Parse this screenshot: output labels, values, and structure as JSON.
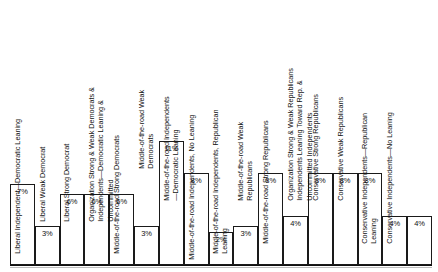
{
  "chart_data": {
    "type": "bar",
    "title": "",
    "xlabel": "",
    "ylabel": "",
    "ylim": [
      0,
      11
    ],
    "grid": false,
    "legend": null,
    "orientation": "vertical",
    "value_suffix": "%",
    "categories": [
      "Liberal Independent—Uncommitted",
      "Liberal Independent—Democratic Leaning",
      "Liberal Weak Democrat",
      "Liberal Strong Democrat",
      "Organization Strong & Weak Democrats & Independents—Democratic Leaning & Uncommitted",
      "Middle-of-the-road Strong Democrats",
      "Middle-of-the-road Weak Democrats",
      "Middle-of-the-road Independents—Democratic Leaning",
      "Middle-of-the-road Independents, No Leaning",
      "Middle-of-the-road Independents, Republican Leaning",
      "Middle-of-the-road Weak Republicans",
      "Middle-of-the-road Strong Republicans",
      "Organization Strong & Weak Republicans Independents Leaning Toward Rep. & Uncommitted Independents",
      "Conservative Strong Republicans",
      "Conservative Weak Republicans",
      "Conservative Independents—Republican Leaning",
      "Conservative Independents—No Leaning"
    ],
    "values": [
      7,
      3,
      6,
      6,
      6,
      3,
      11,
      8,
      2,
      3,
      8,
      4,
      8,
      8,
      8,
      4,
      4
    ],
    "value_labels": [
      "7%",
      "3%",
      "6%",
      "6%",
      "6%",
      "3%",
      "11%",
      "8%",
      "2%",
      "3%",
      "8%",
      "4%",
      "8%",
      "8%",
      "8%",
      "4%",
      "4%"
    ]
  },
  "bars": [
    {
      "value_label": "7%",
      "label_lines": [
        "Liberal Independent—Uncommitted",
        "",
        ""
      ]
    },
    {
      "value_label": "3%",
      "label_lines": [
        "Liberal Independent—Democratic Leaning",
        "",
        ""
      ]
    },
    {
      "value_label": "6%",
      "label_lines": [
        "Liberal Weak Democrat",
        "",
        ""
      ]
    },
    {
      "value_label": "6%",
      "label_lines": [
        "Liberal Strong Democrat",
        "",
        ""
      ]
    },
    {
      "value_label": "6%",
      "label_lines": [
        "Organization Strong & Weak Democrats &",
        "Independents—Democratic Leaning &",
        "Uncommitted"
      ]
    },
    {
      "value_label": "3%",
      "label_lines": [
        "Middle-of-the-road Strong Democrats",
        "",
        ""
      ]
    },
    {
      "value_label": "11%",
      "label_lines": [
        "Middle-of-the-road Weak",
        "Democrats",
        ""
      ]
    },
    {
      "value_label": "8%",
      "label_lines": [
        "Middle-of-the-road Independents",
        "—Democratic Leaning",
        ""
      ]
    },
    {
      "value_label": "2%",
      "label_lines": [
        "Middle-of-the-road Independents, No Leaning",
        "",
        ""
      ]
    },
    {
      "value_label": "3%",
      "label_lines": [
        "Middle-of-the-road Independents, Republican",
        "Leaning",
        ""
      ]
    },
    {
      "value_label": "8%",
      "label_lines": [
        "Middle-of-the-road Weak",
        "Republicans",
        ""
      ]
    },
    {
      "value_label": "4%",
      "label_lines": [
        "Middle-of-the-road Strong Republicans",
        "",
        ""
      ]
    },
    {
      "value_label": "8%",
      "label_lines": [
        "Organization Strong & Weak Republicans",
        "Independents Leaning Toward Rep. &",
        "Uncommitted Independents"
      ]
    },
    {
      "value_label": "8%",
      "label_lines": [
        "Conservative Strong Republicans",
        "",
        ""
      ]
    },
    {
      "value_label": "8%",
      "label_lines": [
        "Conservative Weak Republicans",
        "",
        ""
      ]
    },
    {
      "value_label": "4%",
      "label_lines": [
        "Conservative Independents—Republican",
        "Leaning",
        ""
      ]
    },
    {
      "value_label": "4%",
      "label_lines": [
        "Conservative Independents—No Leaning",
        "",
        ""
      ]
    }
  ]
}
